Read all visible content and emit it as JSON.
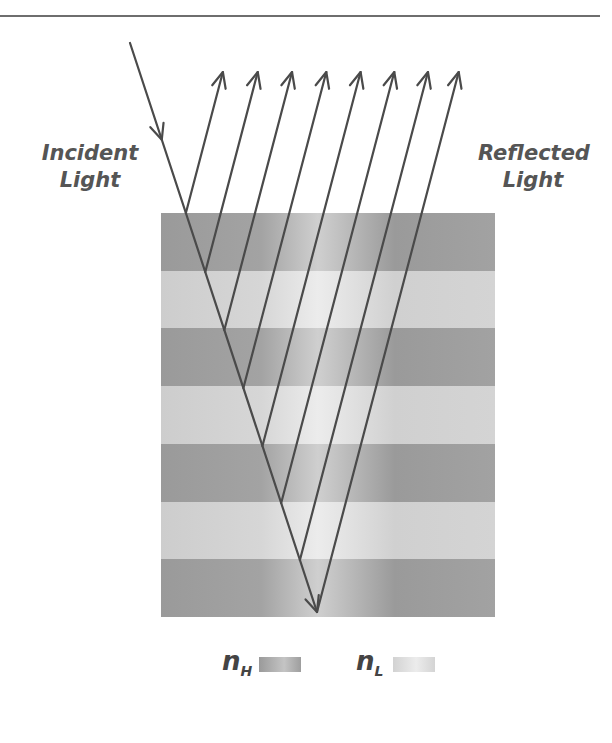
{
  "diagram": {
    "labels": {
      "incident": "Incident Light",
      "incident_line1": "Incident",
      "incident_line2": "Light",
      "reflected_line1": "Reflected",
      "reflected_line2": "Light"
    },
    "layers": [
      "H",
      "L",
      "H",
      "L",
      "H",
      "L",
      "H"
    ],
    "reflected_ray_count": 8,
    "legend": [
      {
        "symbol": "n",
        "subscript": "H",
        "meaning": "high index layer",
        "color": "#a3a3a3"
      },
      {
        "symbol": "n",
        "subscript": "L",
        "meaning": "low index layer",
        "color": "#dedede"
      }
    ],
    "colors": {
      "line": "#4a4a4a",
      "high": "#a3a3a3",
      "low": "#d8d8d8",
      "text": "#555555"
    }
  }
}
